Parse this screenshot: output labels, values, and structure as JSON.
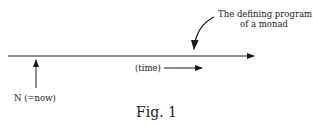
{
  "diagram": {
    "annotation_line1": "The defining program",
    "annotation_line2": "of a monad",
    "time_label": "(time)",
    "now_label": "N (=now)",
    "caption": "Fig. 1"
  }
}
